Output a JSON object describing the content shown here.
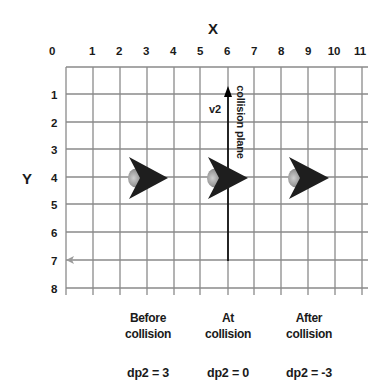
{
  "axes": {
    "x_title": "X",
    "y_title": "Y",
    "x_ticks": [
      "0",
      "1",
      "2",
      "3",
      "4",
      "5",
      "6",
      "7",
      "8",
      "9",
      "10",
      "11"
    ],
    "y_ticks": [
      "1",
      "2",
      "3",
      "4",
      "5",
      "6",
      "7",
      "8"
    ]
  },
  "labels": {
    "vector": "v2",
    "plane": "collision plane"
  },
  "states": [
    {
      "line1": "Before",
      "line2": "collision",
      "dp": "dp2 = 3"
    },
    {
      "line1": "At",
      "line2": "collision",
      "dp": "dp2 = 0"
    },
    {
      "line1": "After",
      "line2": "collision",
      "dp": "dp2 = -3"
    }
  ],
  "colors": {
    "grid": "#8a8a8a",
    "arrow": "#1e1e1e",
    "shadow": "#9a9a9a",
    "plane": "#000000",
    "normal_arrow": "#9a9a9a"
  }
}
